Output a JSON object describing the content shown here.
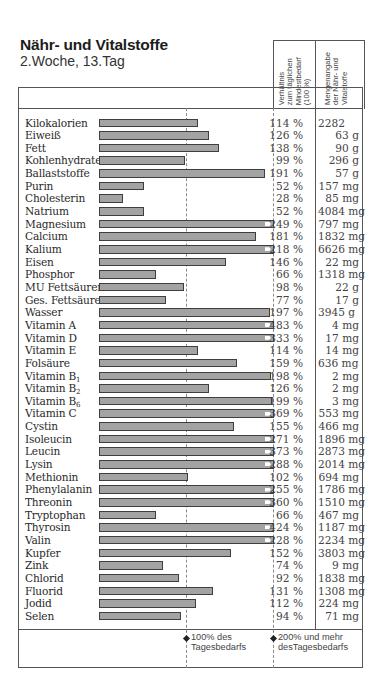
{
  "header": {
    "title": "Nähr- und Vitalstoffe",
    "subtitle": "2.Woche, 13.Tag",
    "col_ratio": "Verhältnis\nzum täglichen\nMindestbedarf\n(100 %)",
    "col_amount": "Mengenangabe\nder Nähr- und\nVitalstoffe"
  },
  "legend": {
    "marker_100": "100% des\nTagesbedarfs",
    "marker_200": "200% und mehr\ndesTagesbedarfs"
  },
  "colors": {
    "bar": "#a3a3a3",
    "bar_border": "#3e3e3e",
    "line": "#555555"
  },
  "chart_data": {
    "type": "bar",
    "orientation": "horizontal",
    "title": "Nähr- und Vitalstoffe",
    "subtitle": "2.Woche, 13.Tag",
    "xlabel": "Verhältnis zum täglichen Mindestbedarf (100 %)",
    "reference_lines": [
      100,
      200
    ],
    "xlim": [
      0,
      200
    ],
    "note": "Bars capped at 200% with white arrow marker when exceeding",
    "categories": [
      "Kilokalorien",
      "Eiweiß",
      "Fett",
      "Kohlenhydrate",
      "Ballaststoffe",
      "Purin",
      "Cholesterin",
      "Natrium",
      "Magnesium",
      "Calcium",
      "Kalium",
      "Eisen",
      "Phosphor",
      "MU Fettsäuren",
      "Ges. Fettsäuren",
      "Wasser",
      "Vitamin A",
      "Vitamin D",
      "Vitamin E",
      "Folsäure",
      "Vitamin B1",
      "Vitamin B2",
      "Vitamin B6",
      "Vitamin C",
      "Cystin",
      "Isoleucin",
      "Leucin",
      "Lysin",
      "Methionin",
      "Phenylalanin",
      "Threonin",
      "Tryptophan",
      "Thyrosin",
      "Valin",
      "Kupfer",
      "Zink",
      "Chlorid",
      "Fluorid",
      "Jodid",
      "Selen"
    ],
    "values": [
      114,
      126,
      138,
      99,
      191,
      52,
      28,
      52,
      249,
      181,
      218,
      146,
      66,
      98,
      77,
      197,
      483,
      333,
      114,
      159,
      198,
      126,
      199,
      369,
      155,
      271,
      373,
      288,
      102,
      255,
      360,
      66,
      424,
      228,
      152,
      74,
      92,
      131,
      112,
      94
    ]
  },
  "rows": [
    {
      "name": "Kilokalorien",
      "sub": "",
      "pct": "114 %",
      "value": 114,
      "amount": "2282",
      "left": true
    },
    {
      "name": "Eiweiß",
      "sub": "",
      "pct": "126 %",
      "value": 126,
      "amount": "63 g"
    },
    {
      "name": "Fett",
      "sub": "",
      "pct": "138 %",
      "value": 138,
      "amount": "90 g"
    },
    {
      "name": "Kohlenhydrate",
      "sub": "",
      "pct": "99 %",
      "value": 99,
      "amount": "296 g"
    },
    {
      "name": "Ballaststoffe",
      "sub": "",
      "pct": "191 %",
      "value": 191,
      "amount": "57 g"
    },
    {
      "name": "Purin",
      "sub": "",
      "pct": "52 %",
      "value": 52,
      "amount": "157 mg"
    },
    {
      "name": "Cholesterin",
      "sub": "",
      "pct": "28 %",
      "value": 28,
      "amount": "85 mg"
    },
    {
      "name": "Natrium",
      "sub": "",
      "pct": "52 %",
      "value": 52,
      "amount": "4084 mg"
    },
    {
      "name": "Magnesium",
      "sub": "",
      "pct": "249 %",
      "value": 249,
      "amount": "797 mg"
    },
    {
      "name": "Calcium",
      "sub": "",
      "pct": "181 %",
      "value": 181,
      "amount": "1832 mg"
    },
    {
      "name": "Kalium",
      "sub": "",
      "pct": "218 %",
      "value": 218,
      "amount": "6626 mg"
    },
    {
      "name": "Eisen",
      "sub": "",
      "pct": "146 %",
      "value": 146,
      "amount": "22 mg"
    },
    {
      "name": "Phosphor",
      "sub": "",
      "pct": "66 %",
      "value": 66,
      "amount": "1318 mg"
    },
    {
      "name": "MU Fettsäuren",
      "sub": "",
      "pct": "98 %",
      "value": 98,
      "amount": "22 g"
    },
    {
      "name": "Ges. Fettsäuren",
      "sub": "",
      "pct": "77 %",
      "value": 77,
      "amount": "17 g"
    },
    {
      "name": "Wasser",
      "sub": "",
      "pct": "197 %",
      "value": 197,
      "amount": "3945 g",
      "left": true
    },
    {
      "name": "Vitamin A",
      "sub": "",
      "pct": "483 %",
      "value": 483,
      "amount": "4 mg"
    },
    {
      "name": "Vitamin D",
      "sub": "",
      "pct": "333 %",
      "value": 333,
      "amount": "17 mg"
    },
    {
      "name": "Vitamin E",
      "sub": "",
      "pct": "114 %",
      "value": 114,
      "amount": "14 mg"
    },
    {
      "name": "Folsäure",
      "sub": "",
      "pct": "159 %",
      "value": 159,
      "amount": "636 mg",
      "left": true
    },
    {
      "name": "Vitamin B",
      "sub": "1",
      "pct": "198 %",
      "value": 198,
      "amount": "2 mg"
    },
    {
      "name": "Vitamin B",
      "sub": "2",
      "pct": "126 %",
      "value": 126,
      "amount": "2 mg"
    },
    {
      "name": "Vitamin B",
      "sub": "6",
      "pct": "199 %",
      "value": 199,
      "amount": "3 mg"
    },
    {
      "name": "Vitamin C",
      "sub": "",
      "pct": "369 %",
      "value": 369,
      "amount": "553 mg"
    },
    {
      "name": "Cystin",
      "sub": "",
      "pct": "155 %",
      "value": 155,
      "amount": "466 mg"
    },
    {
      "name": "Isoleucin",
      "sub": "",
      "pct": "271 %",
      "value": 271,
      "amount": "1896 mg"
    },
    {
      "name": "Leucin",
      "sub": "",
      "pct": "373 %",
      "value": 373,
      "amount": "2873 mg"
    },
    {
      "name": "Lysin",
      "sub": "",
      "pct": "288 %",
      "value": 288,
      "amount": "2014 mg"
    },
    {
      "name": "Methionin",
      "sub": "",
      "pct": "102 %",
      "value": 102,
      "amount": "694 mg"
    },
    {
      "name": "Phenylalanin",
      "sub": "",
      "pct": "255 %",
      "value": 255,
      "amount": "1786 mg"
    },
    {
      "name": "Threonin",
      "sub": "",
      "pct": "360 %",
      "value": 360,
      "amount": "1510 mg"
    },
    {
      "name": "Tryptophan",
      "sub": "",
      "pct": "66 %",
      "value": 66,
      "amount": "467 mg"
    },
    {
      "name": "Thyrosin",
      "sub": "",
      "pct": "424 %",
      "value": 424,
      "amount": "1187 mg"
    },
    {
      "name": "Valin",
      "sub": "",
      "pct": "228 %",
      "value": 228,
      "amount": "2234 mg"
    },
    {
      "name": "Kupfer",
      "sub": "",
      "pct": "152 %",
      "value": 152,
      "amount": "3803 mg",
      "left": true
    },
    {
      "name": "Zink",
      "sub": "",
      "pct": "74 %",
      "value": 74,
      "amount": "9 mg"
    },
    {
      "name": "Chlorid",
      "sub": "",
      "pct": "92 %",
      "value": 92,
      "amount": "1838 mg"
    },
    {
      "name": "Fluorid",
      "sub": "",
      "pct": "131 %",
      "value": 131,
      "amount": "1308 mg",
      "left": true
    },
    {
      "name": "Jodid",
      "sub": "",
      "pct": "112 %",
      "value": 112,
      "amount": "224 mg"
    },
    {
      "name": "Selen",
      "sub": "",
      "pct": "94 %",
      "value": 94,
      "amount": "71 mg"
    }
  ]
}
